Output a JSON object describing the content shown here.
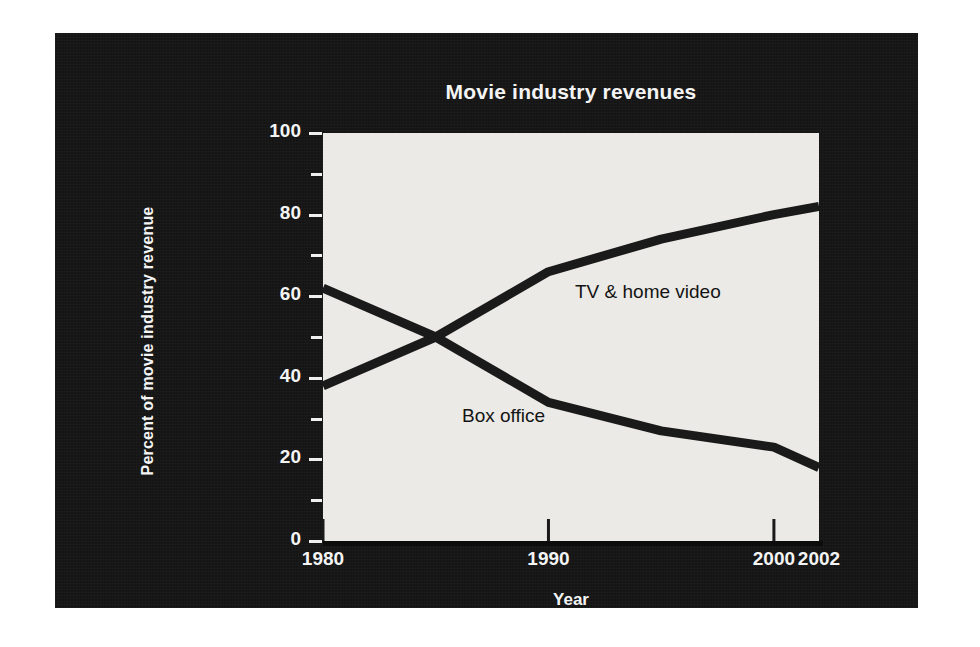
{
  "chart_data": {
    "type": "line",
    "title": "Movie industry revenues",
    "xlabel": "Year",
    "ylabel": "Percent of movie industry revenue",
    "xlim": [
      1980,
      2002
    ],
    "ylim": [
      0,
      100
    ],
    "grid": false,
    "legend_position": "inline-annotations",
    "x_tick_labels": [
      "1980",
      "1990",
      "2000",
      "2002"
    ],
    "x_tick_values": [
      1980,
      1990,
      2000,
      2002
    ],
    "y_tick_labels": [
      "0",
      "20",
      "40",
      "60",
      "80",
      "100"
    ],
    "y_tick_values": [
      0,
      20,
      40,
      60,
      80,
      100
    ],
    "y_minor_tick_values": [
      10,
      30,
      50,
      70,
      90
    ],
    "series": [
      {
        "name": "TV & home video",
        "annotation": "TV & home video",
        "color": "#1a1a1a",
        "x": [
          1980,
          1985,
          1990,
          1995,
          2000,
          2002
        ],
        "values": [
          38,
          50,
          66,
          74,
          80,
          82
        ]
      },
      {
        "name": "Box office",
        "annotation": "Box office",
        "color": "#1a1a1a",
        "x": [
          1980,
          1985,
          1990,
          1995,
          2000,
          2002
        ],
        "values": [
          62,
          50,
          34,
          27,
          23,
          18
        ]
      }
    ]
  },
  "figure": {
    "panel_background": "#151515",
    "plot_background": "#eceae6",
    "text_color": "#f4f4f4",
    "line_color": "#1a1a1a",
    "page_background": "#ffffff"
  }
}
